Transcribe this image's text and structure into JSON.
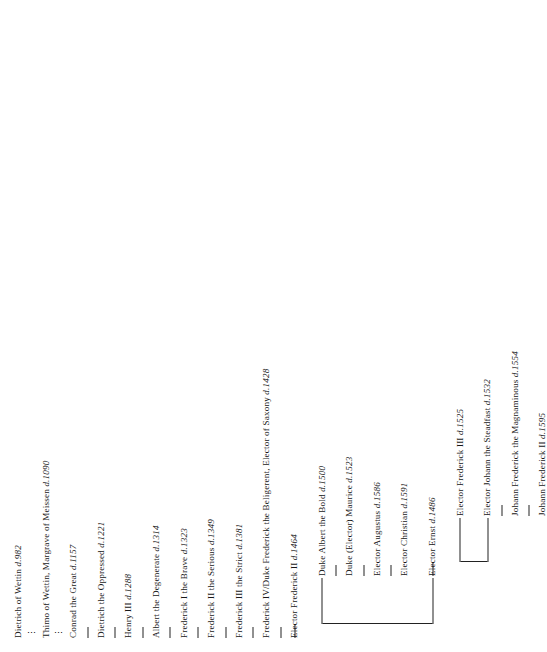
{
  "document": {
    "type": "genealogical-descent-chart",
    "title": "House of Wettin descent chart",
    "orientation": "rotated-90-counterclockwise",
    "notation": {
      "death_marker": "d.",
      "ellipsis": "⋮",
      "link_glyph": "—"
    }
  },
  "chart_data": {
    "type": "diagram",
    "subtype": "family-tree",
    "orientation": "vertical-text-rotated",
    "nodes": [
      {
        "id": "n1",
        "label": "Dietrich of Wettin d.982",
        "name": "Dietrich of Wettin",
        "death": "982",
        "generation": 1,
        "branch": "main"
      },
      {
        "id": "n2",
        "label": "Thimo of Wettin, Margrave of Meissen d.1090",
        "name": "Thimo of Wettin, Margrave of Meissen",
        "death": "1090",
        "generation": 2,
        "branch": "main"
      },
      {
        "id": "n3",
        "label": "Conrad the Great d.1157",
        "name": "Conrad the Great",
        "death": "1157",
        "generation": 3,
        "branch": "main"
      },
      {
        "id": "n4",
        "label": "Dietrich the Oppressed d.1221",
        "name": "Dietrich the Oppressed",
        "death": "1221",
        "generation": 4,
        "branch": "main"
      },
      {
        "id": "n5",
        "label": "Henry III d.1288",
        "name": "Henry III",
        "death": "1288",
        "generation": 5,
        "branch": "main"
      },
      {
        "id": "n6",
        "label": "Albert the Degenerate d.1314",
        "name": "Albert the Degenerate",
        "death": "1314",
        "generation": 6,
        "branch": "main"
      },
      {
        "id": "n7",
        "label": "Frederick I the Brave d.1323",
        "name": "Frederick I the Brave",
        "death": "1323",
        "generation": 7,
        "branch": "main"
      },
      {
        "id": "n8",
        "label": "Frederick II the Serious d.1349",
        "name": "Frederick II the Serious",
        "death": "1349",
        "generation": 8,
        "branch": "main"
      },
      {
        "id": "n9",
        "label": "Frederick III the Strict d.1381",
        "name": "Frederick III the Strict",
        "death": "1381",
        "generation": 9,
        "branch": "main"
      },
      {
        "id": "n10",
        "label": "Frederick IV/Duke Frederick the Beligerent, Elector of Saxony d.1428",
        "name": "Frederick IV/Duke Frederick the Beligerent, Elector of Saxony",
        "death": "1428",
        "generation": 10,
        "branch": "main"
      },
      {
        "id": "n11",
        "label": "Elector Frederick II d.1464",
        "name": "Elector Frederick II",
        "death": "1464",
        "generation": 11,
        "branch": "main"
      },
      {
        "id": "e1",
        "label": "Elector Ernst d.1486",
        "name": "Elector Ernst",
        "death": "1486",
        "generation": 12,
        "branch": "ernestine"
      },
      {
        "id": "e2",
        "label": "Elector Frederick III d.1525",
        "name": "Elector Frederick III",
        "death": "1525",
        "generation": 13,
        "branch": "ernestine"
      },
      {
        "id": "e3",
        "label": "Elector Johann the Steadfast d.1532",
        "name": "Elector Johann the Steadfast",
        "death": "1532",
        "generation": 13,
        "branch": "ernestine"
      },
      {
        "id": "e4",
        "label": "Johann Frederick the Magnaminous d.1554",
        "name": "Johann Frederick the Magnaminous",
        "death": "1554",
        "generation": 14,
        "branch": "ernestine"
      },
      {
        "id": "e5",
        "label": "Johann Frederick II  d.1595",
        "name": "Johann Frederick II",
        "death": "1595",
        "generation": 15,
        "branch": "ernestine"
      },
      {
        "id": "a1",
        "label": "Duke Albert the Bold d.1500",
        "name": "Duke Albert the Bold",
        "death": "1500",
        "generation": 12,
        "branch": "albertine"
      },
      {
        "id": "a2",
        "label": "Duke (Elector) Maurice d.1523",
        "name": "Duke (Elector) Maurice",
        "death": "1523",
        "generation": 13,
        "branch": "albertine"
      },
      {
        "id": "a3",
        "label": "Elector Augustus d.1586",
        "name": "Elector Augustus",
        "death": "1586",
        "generation": 14,
        "branch": "albertine"
      },
      {
        "id": "a4",
        "label": "Elector Christian d.1591",
        "name": "Elector Christian",
        "death": "1591",
        "generation": 15,
        "branch": "albertine"
      }
    ],
    "edges": [
      {
        "from": "n1",
        "to": "n2",
        "style": "ellipsis"
      },
      {
        "from": "n2",
        "to": "n3",
        "style": "ellipsis"
      },
      {
        "from": "n3",
        "to": "n4",
        "style": "line"
      },
      {
        "from": "n4",
        "to": "n5",
        "style": "line"
      },
      {
        "from": "n5",
        "to": "n6",
        "style": "line"
      },
      {
        "from": "n6",
        "to": "n7",
        "style": "line"
      },
      {
        "from": "n7",
        "to": "n8",
        "style": "line"
      },
      {
        "from": "n8",
        "to": "n9",
        "style": "line"
      },
      {
        "from": "n9",
        "to": "n10",
        "style": "line"
      },
      {
        "from": "n10",
        "to": "n11",
        "style": "line"
      },
      {
        "from": "n11",
        "to": "e1",
        "style": "bracket"
      },
      {
        "from": "n11",
        "to": "a1",
        "style": "bracket"
      },
      {
        "from": "e1",
        "to": "e2",
        "style": "bracket"
      },
      {
        "from": "e1",
        "to": "e3",
        "style": "bracket"
      },
      {
        "from": "e3",
        "to": "e4",
        "style": "line"
      },
      {
        "from": "e4",
        "to": "e5",
        "style": "line"
      },
      {
        "from": "a1",
        "to": "a2",
        "style": "line"
      },
      {
        "from": "a2",
        "to": "a3",
        "style": "line"
      },
      {
        "from": "a3",
        "to": "a4",
        "style": "line"
      }
    ]
  }
}
